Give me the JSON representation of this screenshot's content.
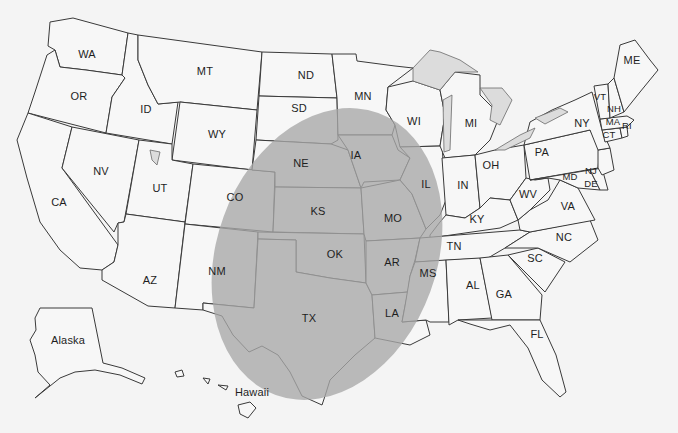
{
  "map": {
    "title": "United States map with highlighted south-central region",
    "highlight_color": "#a8a8a8",
    "background_color": "#f4f4f4",
    "highlighted_states": [
      "NE",
      "IA",
      "KS",
      "MO",
      "OK",
      "AR",
      "TX",
      "LA",
      "NM",
      "CO"
    ],
    "labels": {
      "WA": "WA",
      "OR": "OR",
      "CA": "CA",
      "ID": "ID",
      "NV": "NV",
      "MT": "MT",
      "WY": "WY",
      "UT": "UT",
      "AZ": "AZ",
      "CO": "CO",
      "NM": "NM",
      "ND": "ND",
      "SD": "SD",
      "NE": "NE",
      "KS": "KS",
      "OK": "OK",
      "TX": "TX",
      "MN": "MN",
      "IA": "IA",
      "MO": "MO",
      "AR": "AR",
      "LA": "LA",
      "WI": "WI",
      "IL": "IL",
      "MI": "MI",
      "IN": "IN",
      "OH": "OH",
      "KY": "KY",
      "TN": "TN",
      "MS": "MS",
      "AL": "AL",
      "GA": "GA",
      "FL": "FL",
      "SC": "SC",
      "NC": "NC",
      "VA": "VA",
      "WV": "WV",
      "PA": "PA",
      "NY": "NY",
      "MD": "MD",
      "DE": "DE",
      "NJ": "NJ",
      "CT": "CT",
      "RI": "RI",
      "MA": "MA",
      "VT": "VT",
      "NH": "NH",
      "ME": "ME",
      "Alaska": "Alaska",
      "Hawaii": "Hawaii"
    }
  }
}
